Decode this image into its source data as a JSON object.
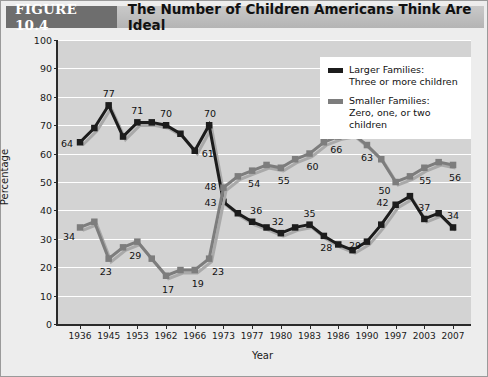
{
  "header": {
    "figure_tag": "FIGURE 10.4",
    "title": "The Number of Children Americans Think Are Ideal"
  },
  "legend": {
    "entries": [
      {
        "name": "Larger Families:",
        "detail": "Three or more children",
        "color": "#1c1c1c"
      },
      {
        "name": "Smaller Families:",
        "detail": "Zero, one, or two children",
        "color": "#7d7d7d"
      }
    ]
  },
  "chart_data": {
    "type": "line",
    "title": "The Number of Children Americans Think Are Ideal",
    "xlabel": "Year",
    "ylabel": "Percentage",
    "ylim": [
      0,
      100
    ],
    "ytick_step": 10,
    "yticks": [
      0,
      10,
      20,
      30,
      40,
      50,
      60,
      70,
      80,
      90,
      100
    ],
    "grid": "horizontal",
    "legend_position": "top-right",
    "categories": [
      "1936",
      "1945",
      "1953",
      "1962",
      "1966",
      "1973",
      "1977",
      "1980",
      "1983",
      "1986",
      "1990",
      "1997",
      "2003",
      "2007"
    ],
    "series": [
      {
        "name": "Larger Families: Three or more children",
        "color": "#1c1c1c",
        "values": [
          64,
          77,
          71,
          70,
          61,
          43,
          36,
          32,
          35,
          28,
          29,
          42,
          37,
          34
        ],
        "labels": [
          "64",
          "77",
          "71",
          "70",
          "61",
          "43",
          "36",
          "32",
          "35",
          "28",
          "29",
          "42",
          "37",
          "34"
        ],
        "interpolated_points": [
          69,
          66,
          71,
          67,
          70,
          39,
          34,
          34,
          31,
          26,
          35,
          45,
          39
        ],
        "annotation_extra": {
          "year": "1966-1973 midpoint",
          "value": 70,
          "label": "70"
        }
      },
      {
        "name": "Smaller Families: Zero, one, or two children",
        "color": "#7d7d7d",
        "values": [
          34,
          23,
          29,
          17,
          19,
          48,
          54,
          55,
          60,
          66,
          63,
          50,
          55,
          56
        ],
        "labels": [
          "34",
          "23",
          "29",
          "17",
          "19",
          "48",
          "54",
          "55",
          "60",
          "66",
          "63",
          "50",
          "55",
          "56"
        ],
        "interpolated_points": [
          36,
          27,
          23,
          19,
          23,
          52,
          56,
          58,
          64,
          67,
          58,
          52,
          57
        ],
        "annotation_extra": {
          "year": "1966-1973 midpoint",
          "value": 23,
          "label": "23"
        }
      }
    ]
  }
}
